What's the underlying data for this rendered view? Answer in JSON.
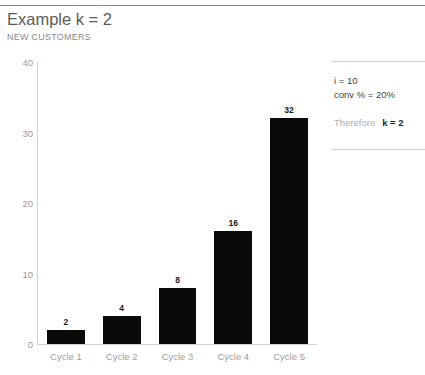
{
  "top_fragment": "",
  "header": {
    "title": "Example k = 2",
    "subtitle": "NEW CUSTOMERS"
  },
  "side_panel": {
    "line1": "i = 10",
    "line2": "conv % = 20%",
    "conclusion_prefix": "Therefore",
    "conclusion_value": "k = 2"
  },
  "chart_data": {
    "type": "bar",
    "title": "Example k = 2",
    "subtitle": "NEW CUSTOMERS",
    "categories": [
      "Cycle 1",
      "Cycle 2",
      "Cycle 3",
      "Cycle 4",
      "Cycle 5"
    ],
    "values": [
      2,
      4,
      8,
      16,
      32
    ],
    "data_labels": [
      "2",
      "4",
      "8",
      "16",
      "32"
    ],
    "xlabel": "",
    "ylabel": "",
    "ylim": [
      0,
      40
    ],
    "yticks": [
      0,
      10,
      20,
      30,
      40
    ],
    "ytick_labels": [
      "0",
      "10",
      "20",
      "30",
      "40"
    ],
    "grid": false,
    "legend": false,
    "bar_color": "#0a0a0a",
    "axis_color": "#d2d2d2",
    "tick_label_color": "#9a9a9a"
  }
}
